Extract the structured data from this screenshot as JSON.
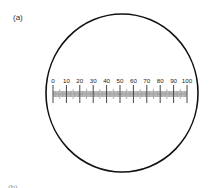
{
  "figure": {
    "panel_label": "(a)",
    "next_panel_label": "(b)",
    "eyepiece": {
      "shape": "circle",
      "stroke_color": "#111111"
    },
    "scale": {
      "min": 0,
      "max": 100,
      "major_step": 10,
      "minor_step": 1,
      "labels": [
        "0",
        "10",
        "20",
        "30",
        "40",
        "50",
        "60",
        "70",
        "80",
        "90",
        "100"
      ],
      "major_tick_color": "#444444",
      "minor_tick_color": "#9a9a9a",
      "band_color": "#bdbdbd"
    }
  }
}
